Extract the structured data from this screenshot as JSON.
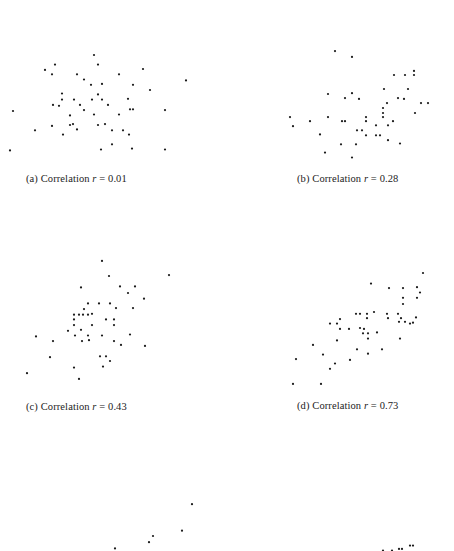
{
  "figure": {
    "panels": [
      {
        "tag": "(a)",
        "label_prefix": "Correlation",
        "var": "r",
        "eq": "=",
        "value": "0.01"
      },
      {
        "tag": "(b)",
        "label_prefix": "Correlation",
        "var": "r",
        "eq": "=",
        "value": "0.28"
      },
      {
        "tag": "(c)",
        "label_prefix": "Correlation",
        "var": "r",
        "eq": "=",
        "value": "0.43"
      },
      {
        "tag": "(d)",
        "label_prefix": "Correlation",
        "var": "r",
        "eq": "=",
        "value": "0.73"
      }
    ]
  },
  "chart_data": [
    {
      "type": "scatter",
      "title": "(a) Correlation r = 0.01",
      "correlation": 0.01,
      "xlabel": "",
      "ylabel": "",
      "xlim": [
        0,
        200
      ],
      "ylim": [
        0,
        160
      ],
      "grid": false,
      "points": [
        [
          94,
          120
        ],
        [
          55,
          109
        ],
        [
          98,
          109
        ],
        [
          45,
          103
        ],
        [
          52,
          98
        ],
        [
          143,
          104
        ],
        [
          77,
          98
        ],
        [
          119,
          98
        ],
        [
          84,
          92
        ],
        [
          186,
          91
        ],
        [
          91,
          86
        ],
        [
          102,
          87
        ],
        [
          133,
          86
        ],
        [
          150,
          80
        ],
        [
          62,
          76
        ],
        [
          98,
          75
        ],
        [
          62,
          69
        ],
        [
          74,
          69
        ],
        [
          92,
          69
        ],
        [
          102,
          69
        ],
        [
          128,
          70
        ],
        [
          53,
          63
        ],
        [
          59,
          62
        ],
        [
          80,
          63
        ],
        [
          108,
          63
        ],
        [
          84,
          57
        ],
        [
          13,
          56
        ],
        [
          130,
          58
        ],
        [
          133,
          58
        ],
        [
          165,
          57
        ],
        [
          70,
          51
        ],
        [
          94,
          52
        ],
        [
          119,
          52
        ],
        [
          52,
          39
        ],
        [
          70,
          40
        ],
        [
          73,
          41
        ],
        [
          98,
          40
        ],
        [
          105,
          41
        ],
        [
          35,
          34
        ],
        [
          77,
          35
        ],
        [
          112,
          34
        ],
        [
          123,
          34
        ],
        [
          63,
          29
        ],
        [
          129,
          29
        ],
        [
          112,
          18
        ],
        [
          10,
          11
        ],
        [
          101,
          12
        ],
        [
          132,
          13
        ],
        [
          165,
          12
        ]
      ]
    },
    {
      "type": "scatter",
      "title": "(b) Correlation r = 0.28",
      "correlation": 0.28,
      "xlabel": "",
      "ylabel": "",
      "xlim": [
        280,
        440
      ],
      "ylim": [
        0,
        160
      ],
      "grid": false,
      "points": [
        [
          335,
          132
        ],
        [
          352,
          125
        ],
        [
          394,
          103
        ],
        [
          405,
          103
        ],
        [
          414,
          108
        ],
        [
          414,
          103
        ],
        [
          384,
          86
        ],
        [
          408,
          86
        ],
        [
          328,
          80
        ],
        [
          352,
          81
        ],
        [
          345,
          75
        ],
        [
          359,
          74
        ],
        [
          398,
          75
        ],
        [
          404,
          74
        ],
        [
          421,
          69
        ],
        [
          428,
          69
        ],
        [
          387,
          69
        ],
        [
          383,
          63
        ],
        [
          383,
          57
        ],
        [
          415,
          57
        ],
        [
          290,
          52
        ],
        [
          328,
          52
        ],
        [
          366,
          52
        ],
        [
          383,
          52
        ],
        [
          366,
          47
        ],
        [
          342,
          47
        ],
        [
          345,
          47
        ],
        [
          310,
          47
        ],
        [
          393,
          47
        ],
        [
          388,
          42
        ],
        [
          376,
          42
        ],
        [
          357,
          36
        ],
        [
          362,
          36
        ],
        [
          293,
          41
        ],
        [
          376,
          30
        ],
        [
          320,
          31
        ],
        [
          366,
          30
        ],
        [
          380,
          30
        ],
        [
          388,
          24
        ],
        [
          341,
          19
        ],
        [
          356,
          19
        ],
        [
          400,
          20
        ],
        [
          325,
          9
        ],
        [
          352,
          3
        ]
      ]
    },
    {
      "type": "scatter",
      "title": "(c) Correlation r = 0.43",
      "correlation": 0.43,
      "xlabel": "",
      "ylabel": "",
      "xlim": [
        0,
        200
      ],
      "ylim": [
        0,
        160
      ],
      "grid": false,
      "points": [
        [
          102,
          141
        ],
        [
          109,
          125
        ],
        [
          169,
          126
        ],
        [
          81,
          113
        ],
        [
          120,
          114
        ],
        [
          135,
          114
        ],
        [
          128,
          107
        ],
        [
          144,
          101
        ],
        [
          88,
          96
        ],
        [
          99,
          96
        ],
        [
          110,
          96
        ],
        [
          84,
          90
        ],
        [
          116,
          91
        ],
        [
          133,
          91
        ],
        [
          74,
          84
        ],
        [
          79,
          84
        ],
        [
          83,
          84
        ],
        [
          88,
          84
        ],
        [
          92,
          85
        ],
        [
          74,
          79
        ],
        [
          106,
          79
        ],
        [
          114,
          79
        ],
        [
          74,
          73
        ],
        [
          92,
          73
        ],
        [
          114,
          73
        ],
        [
          68,
          67
        ],
        [
          81,
          68
        ],
        [
          36,
          61
        ],
        [
          75,
          62
        ],
        [
          88,
          62
        ],
        [
          102,
          62
        ],
        [
          130,
          63
        ],
        [
          53,
          56
        ],
        [
          82,
          56
        ],
        [
          89,
          57
        ],
        [
          114,
          56
        ],
        [
          121,
          52
        ],
        [
          145,
          51
        ],
        [
          100,
          40
        ],
        [
          106,
          40
        ],
        [
          110,
          35
        ],
        [
          50,
          39
        ],
        [
          74,
          28
        ],
        [
          103,
          29
        ],
        [
          27,
          22
        ],
        [
          79,
          16
        ]
      ]
    },
    {
      "type": "scatter",
      "title": "(d) Correlation r = 0.73",
      "correlation": 0.73,
      "xlabel": "",
      "ylabel": "",
      "xlim": [
        280,
        440
      ],
      "ylim": [
        0,
        160
      ],
      "grid": false,
      "points": [
        [
          423,
          142
        ],
        [
          371,
          130
        ],
        [
          389,
          125
        ],
        [
          403,
          125
        ],
        [
          417,
          126
        ],
        [
          420,
          120
        ],
        [
          417,
          114
        ],
        [
          403,
          114
        ],
        [
          403,
          107
        ],
        [
          374,
          98
        ],
        [
          356,
          96
        ],
        [
          360,
          96
        ],
        [
          367,
          96
        ],
        [
          387,
          96
        ],
        [
          388,
          91
        ],
        [
          398,
          96
        ],
        [
          401,
          91
        ],
        [
          399,
          87
        ],
        [
          405,
          87
        ],
        [
          367,
          91
        ],
        [
          340,
          90
        ],
        [
          337,
          85
        ],
        [
          360,
          80
        ],
        [
          416,
          92
        ],
        [
          413,
          86
        ],
        [
          410,
          85
        ],
        [
          330,
          85
        ],
        [
          340,
          79
        ],
        [
          349,
          79
        ],
        [
          364,
          79
        ],
        [
          363,
          74
        ],
        [
          368,
          74
        ],
        [
          377,
          75
        ],
        [
          400,
          68
        ],
        [
          337,
          66
        ],
        [
          368,
          68
        ],
        [
          313,
          61
        ],
        [
          357,
          56
        ],
        [
          323,
          50
        ],
        [
          368,
          51
        ],
        [
          382,
          56
        ],
        [
          350,
          44
        ],
        [
          335,
          40
        ],
        [
          330,
          34
        ],
        [
          296,
          45
        ],
        [
          293,
          17
        ],
        [
          321,
          17
        ]
      ]
    },
    {
      "type": "scatter",
      "title": "",
      "partial": true,
      "xlabel": "",
      "ylabel": "",
      "xlim": [
        0,
        200
      ],
      "ylim": [
        0,
        60
      ],
      "grid": false,
      "points": [
        [
          192,
          53
        ],
        [
          182,
          23
        ],
        [
          153,
          17
        ],
        [
          149,
          10
        ],
        [
          115,
          3
        ]
      ]
    },
    {
      "type": "scatter",
      "title": "",
      "partial": true,
      "xlabel": "",
      "ylabel": "",
      "xlim": [
        280,
        440
      ],
      "ylim": [
        0,
        60
      ],
      "grid": false,
      "points": [
        [
          410,
          18
        ],
        [
          413,
          18
        ],
        [
          399,
          7
        ],
        [
          402,
          7
        ],
        [
          383,
          1
        ],
        [
          392,
          1
        ]
      ]
    }
  ]
}
